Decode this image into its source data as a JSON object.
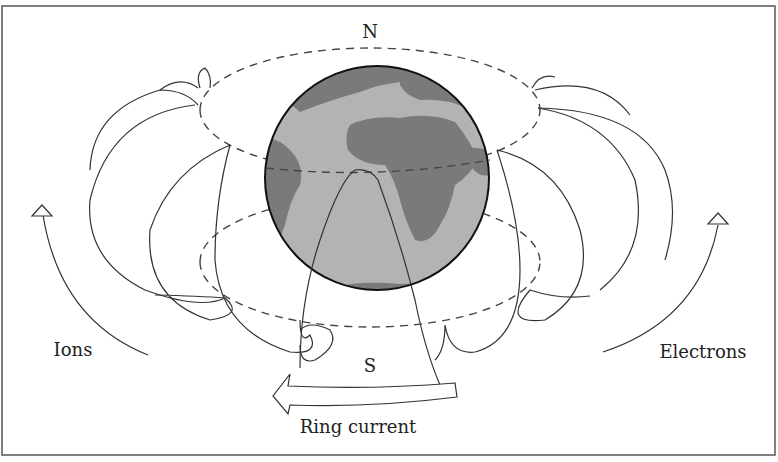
{
  "diagram": {
    "labels": {
      "north": "N",
      "south": "S",
      "ions": "Ions",
      "electrons": "Electrons",
      "ring_current": "Ring current"
    },
    "colors": {
      "ocean": "#b3b3b3",
      "land": "#7a7a7a",
      "globe_outline": "#111111",
      "lines": "#333333",
      "frame": "#555555",
      "background": "#ffffff"
    },
    "elements": [
      "frame",
      "globe",
      "upper-dashed-orbit",
      "lower-dashed-orbit",
      "field-line-loops-left",
      "field-line-loops-right",
      "ion-drift-arrow",
      "electron-drift-arrow",
      "ring-current-arrow"
    ]
  }
}
